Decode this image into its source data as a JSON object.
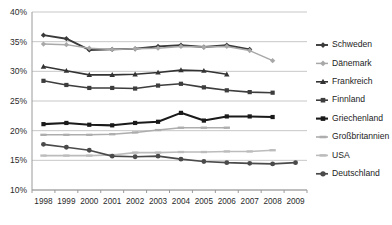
{
  "chart_data": {
    "type": "line",
    "title": "",
    "subtitle": "",
    "xlabel": "",
    "ylabel": "",
    "grid": true,
    "legend_position": "right",
    "x": [
      1998,
      1999,
      2000,
      2001,
      2002,
      2003,
      2004,
      2005,
      2006,
      2007,
      2008,
      2009
    ],
    "categories": [
      "1998",
      "1999",
      "2000",
      "2001",
      "2002",
      "2003",
      "2004",
      "2005",
      "2006",
      "2007",
      "2008",
      "2009"
    ],
    "ylim": [
      10,
      40
    ],
    "ytick_values": [
      10,
      15,
      20,
      25,
      30,
      35,
      40
    ],
    "ytick_labels": [
      "10%",
      "15%",
      "20%",
      "25%",
      "30%",
      "35%",
      "40%"
    ],
    "series": [
      {
        "name": "Schweden",
        "color": "#3a3a3a",
        "marker": "diamond",
        "width": 1.9,
        "values": [
          36.1,
          35.5,
          33.6,
          33.7,
          33.8,
          34.2,
          34.4,
          34.1,
          34.4,
          33.7,
          null,
          null
        ]
      },
      {
        "name": "Dänemark",
        "color": "#a8a8a8",
        "marker": "diamond",
        "width": 1.5,
        "values": [
          34.6,
          34.5,
          33.9,
          33.7,
          33.8,
          33.9,
          34.2,
          34.1,
          34.2,
          33.5,
          31.8,
          null
        ]
      },
      {
        "name": "Frankreich",
        "color": "#333333",
        "marker": "triangle",
        "width": 1.6,
        "values": [
          30.8,
          30.1,
          29.4,
          29.4,
          29.5,
          29.8,
          30.2,
          30.1,
          29.5,
          null,
          null,
          null
        ]
      },
      {
        "name": "Finnland",
        "color": "#3d3d3d",
        "marker": "square",
        "width": 1.6,
        "values": [
          28.4,
          27.7,
          27.2,
          27.2,
          27.1,
          27.6,
          27.9,
          27.3,
          26.8,
          26.5,
          26.4,
          null
        ]
      },
      {
        "name": "Griechenland",
        "color": "#1a1a1a",
        "marker": "square",
        "width": 2.1,
        "values": [
          21.1,
          21.3,
          21.0,
          20.9,
          21.3,
          21.5,
          23.0,
          21.7,
          22.4,
          22.4,
          22.3,
          null
        ]
      },
      {
        "name": "Großbritannien",
        "color": "#adadad",
        "marker": "dash",
        "width": 1.6,
        "values": [
          19.3,
          19.3,
          19.3,
          19.4,
          19.7,
          20.1,
          20.5,
          20.5,
          20.5,
          null,
          null,
          null
        ]
      },
      {
        "name": "USA",
        "color": "#bcbcbc",
        "marker": "dash",
        "width": 1.6,
        "values": [
          15.8,
          15.8,
          15.8,
          15.9,
          16.3,
          16.3,
          16.4,
          16.4,
          16.5,
          16.5,
          16.7,
          null
        ]
      },
      {
        "name": "Deutschland",
        "color": "#4a4a4a",
        "marker": "circle",
        "width": 1.7,
        "values": [
          17.7,
          17.2,
          16.7,
          15.7,
          15.6,
          15.7,
          15.2,
          14.8,
          14.6,
          14.5,
          14.4,
          14.6
        ]
      }
    ]
  },
  "legend": {
    "items": [
      {
        "label": "Schweden"
      },
      {
        "label": "Dänemark"
      },
      {
        "label": "Frankreich"
      },
      {
        "label": "Finnland"
      },
      {
        "label": "Griechenland"
      },
      {
        "label": "Großbritannien"
      },
      {
        "label": "USA"
      },
      {
        "label": "Deutschland"
      }
    ]
  }
}
